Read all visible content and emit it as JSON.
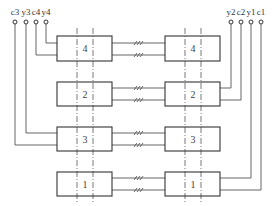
{
  "diagram": {
    "type": "block-wiring-schematic",
    "colors": {
      "line": "#555555",
      "box": "#333333",
      "background": "#ffffff"
    },
    "terminals_left": [
      {
        "label": "c3",
        "x": 15
      },
      {
        "label": "y3",
        "x": 26
      },
      {
        "label": "c4",
        "x": 36
      },
      {
        "label": "y4",
        "x": 46
      }
    ],
    "terminals_right": [
      {
        "label": "y2",
        "x": 231
      },
      {
        "label": "c2",
        "x": 241
      },
      {
        "label": "y1",
        "x": 251
      },
      {
        "label": "c1",
        "x": 261
      }
    ],
    "rows": [
      {
        "label": "4",
        "top": 36,
        "height": 25
      },
      {
        "label": "2",
        "top": 82,
        "height": 24
      },
      {
        "label": "3",
        "top": 127,
        "height": 24
      },
      {
        "label": "1",
        "top": 172,
        "height": 24
      }
    ],
    "connectors_symbol": "///"
  }
}
